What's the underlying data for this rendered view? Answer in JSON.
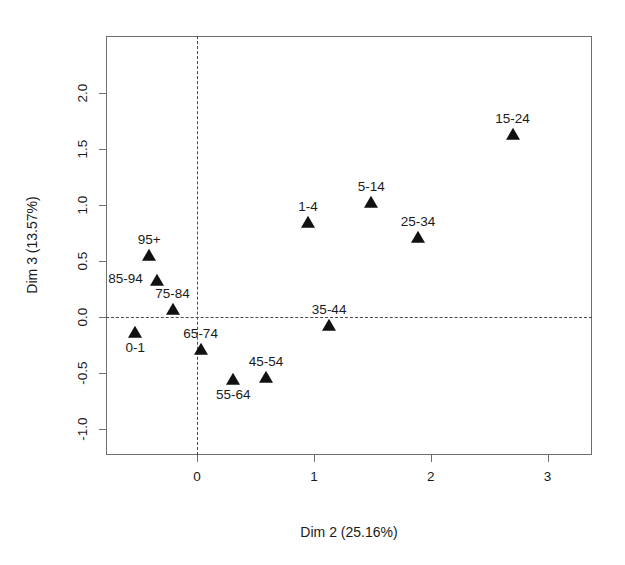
{
  "chart_data": {
    "type": "scatter",
    "title": "",
    "xlabel": "Dim 2 (25.16%)",
    "ylabel": "Dim 3 (13.57%)",
    "xlim": [
      -0.78,
      3.38
    ],
    "ylim": [
      -1.23,
      2.51
    ],
    "xticks": [
      0,
      1,
      2,
      3
    ],
    "xtick_labels": [
      "0",
      "1",
      "2",
      "3"
    ],
    "yticks": [
      -1.0,
      -0.5,
      0.0,
      0.5,
      1.0,
      1.5,
      2.0
    ],
    "ytick_labels": [
      "-1.0",
      "-0.5",
      "0.0",
      "0.5",
      "1.0",
      "1.5",
      "2.0"
    ],
    "grid": false,
    "legend": "none",
    "reference_lines": {
      "horizontal": 0.0,
      "vertical": 0.0,
      "style": "dashed"
    },
    "marker": "filled-triangle",
    "marker_color": "#111111",
    "points": [
      {
        "label": "15-24",
        "x": 2.7,
        "y": 1.63,
        "label_pos": "above"
      },
      {
        "label": "5-14",
        "x": 1.49,
        "y": 1.02,
        "label_pos": "above"
      },
      {
        "label": "25-34",
        "x": 1.89,
        "y": 0.71,
        "label_pos": "above"
      },
      {
        "label": "1-4",
        "x": 0.95,
        "y": 0.84,
        "label_pos": "above"
      },
      {
        "label": "95+",
        "x": -0.41,
        "y": 0.55,
        "label_pos": "above"
      },
      {
        "label": "85-94",
        "x": -0.34,
        "y": 0.32,
        "label_pos": "left"
      },
      {
        "label": "75-84",
        "x": -0.21,
        "y": 0.06,
        "label_pos": "above"
      },
      {
        "label": "35-44",
        "x": 1.13,
        "y": -0.08,
        "label_pos": "above"
      },
      {
        "label": "0-1",
        "x": -0.53,
        "y": -0.14,
        "label_pos": "below"
      },
      {
        "label": "65-74",
        "x": 0.03,
        "y": -0.29,
        "label_pos": "above"
      },
      {
        "label": "45-54",
        "x": 0.59,
        "y": -0.54,
        "label_pos": "above"
      },
      {
        "label": "55-64",
        "x": 0.31,
        "y": -0.56,
        "label_pos": "below"
      }
    ]
  }
}
